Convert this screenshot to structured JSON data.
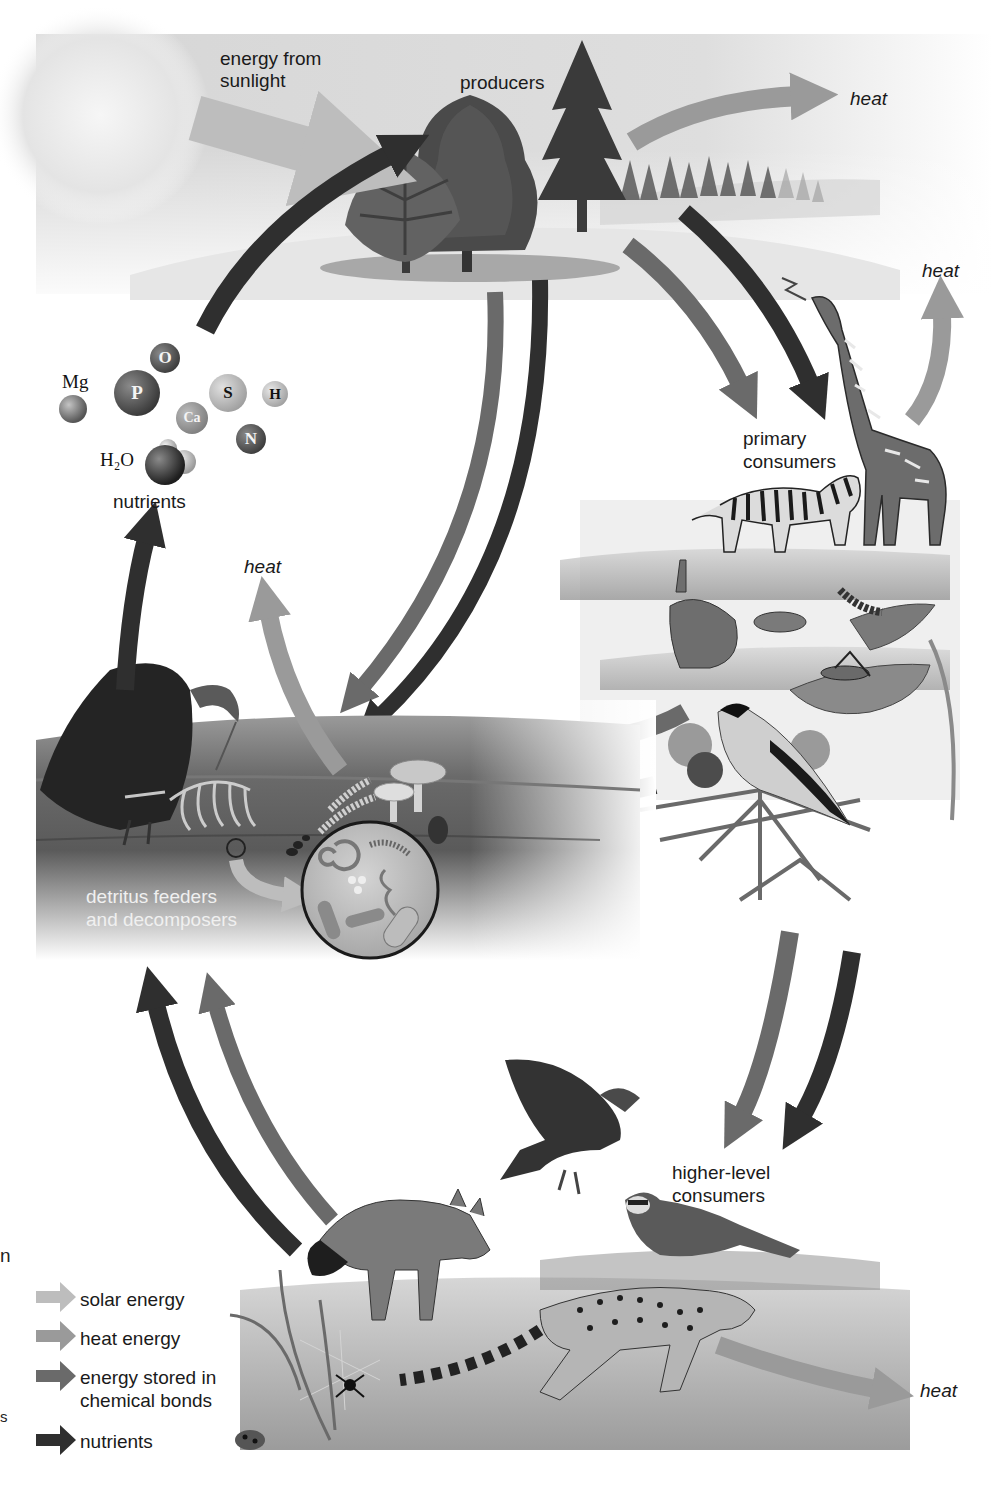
{
  "diagram": {
    "colors": {
      "solar_energy": "#bdbdbd",
      "heat_energy": "#9a9a9a",
      "chemical_energy": "#6a6a6a",
      "nutrients": "#2f2f2f",
      "background": "#ffffff",
      "sky": "#dcdcdc",
      "soil": "#5e5e5e"
    },
    "labels": {
      "energy_from_sunlight_line1": "energy from",
      "energy_from_sunlight_line2": "sunlight",
      "producers": "producers",
      "heat_top": "heat",
      "heat_giraffe": "heat",
      "primary_consumers_line1": "primary",
      "primary_consumers_line2": "consumers",
      "nutrients": "nutrients",
      "heat_decomposers": "heat",
      "detritus_line1": "detritus feeders",
      "detritus_line2": "and decomposers",
      "higher_level_line1": "higher-level",
      "higher_level_line2": "consumers",
      "heat_bottom": "heat"
    },
    "nutrient_elements": [
      {
        "symbol": "O",
        "kind": "sphere"
      },
      {
        "symbol": "Mg",
        "kind": "external-label"
      },
      {
        "symbol": "P",
        "kind": "sphere"
      },
      {
        "symbol": "Ca",
        "kind": "sphere"
      },
      {
        "symbol": "S",
        "kind": "sphere"
      },
      {
        "symbol": "H",
        "kind": "sphere"
      },
      {
        "symbol": "N",
        "kind": "sphere"
      },
      {
        "symbol": "H₂O",
        "kind": "external-label"
      }
    ],
    "legend": {
      "items": [
        {
          "label": "solar energy",
          "color": "#bdbdbd"
        },
        {
          "label": "heat energy",
          "color": "#9a9a9a"
        },
        {
          "label": "energy stored in",
          "label2": "chemical bonds",
          "color": "#6a6a6a"
        },
        {
          "label": "nutrients",
          "color": "#2f2f2f"
        }
      ]
    },
    "edge_fragments": {
      "frag1": "n",
      "frag2": "s"
    },
    "nodes": [
      {
        "id": "sun",
        "label": "energy from sunlight"
      },
      {
        "id": "producers",
        "label": "producers"
      },
      {
        "id": "primary",
        "label": "primary consumers"
      },
      {
        "id": "higher",
        "label": "higher-level consumers"
      },
      {
        "id": "decomposers",
        "label": "detritus feeders and decomposers"
      },
      {
        "id": "nutrients",
        "label": "nutrients"
      }
    ],
    "edges": [
      {
        "from": "sun",
        "to": "producers",
        "type": "solar energy"
      },
      {
        "from": "producers",
        "to": "heat",
        "type": "heat energy"
      },
      {
        "from": "producers",
        "to": "primary",
        "type": "energy stored in chemical bonds"
      },
      {
        "from": "producers",
        "to": "primary",
        "type": "nutrients"
      },
      {
        "from": "producers",
        "to": "decomposers",
        "type": "energy stored in chemical bonds"
      },
      {
        "from": "producers",
        "to": "decomposers",
        "type": "nutrients"
      },
      {
        "from": "primary",
        "to": "heat",
        "type": "heat energy"
      },
      {
        "from": "primary",
        "to": "decomposers",
        "type": "energy stored in chemical bonds"
      },
      {
        "from": "primary",
        "to": "decomposers",
        "type": "nutrients"
      },
      {
        "from": "primary",
        "to": "higher",
        "type": "energy stored in chemical bonds"
      },
      {
        "from": "primary",
        "to": "higher",
        "type": "nutrients"
      },
      {
        "from": "higher",
        "to": "heat",
        "type": "heat energy"
      },
      {
        "from": "higher",
        "to": "decomposers",
        "type": "energy stored in chemical bonds"
      },
      {
        "from": "higher",
        "to": "decomposers",
        "type": "nutrients"
      },
      {
        "from": "decomposers",
        "to": "heat",
        "type": "heat energy"
      },
      {
        "from": "decomposers",
        "to": "nutrients",
        "type": "nutrients"
      },
      {
        "from": "nutrients",
        "to": "producers",
        "type": "nutrients"
      }
    ]
  }
}
